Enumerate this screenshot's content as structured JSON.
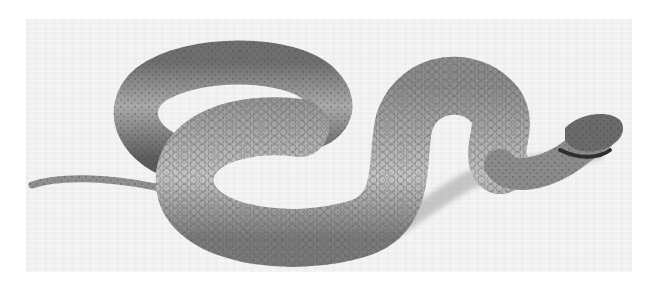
{
  "image": {
    "subject": "snake",
    "description": "Black-and-white photograph of a viper in an S-shaped coil on a pale background, head at right, thin tail extending left",
    "tone": "grayscale",
    "colors": {
      "page_background": "#ffffff",
      "photo_background": "#f1f1f1",
      "body_mid": "#8a8a8a",
      "body_light": "#bdbdbd",
      "body_dark": "#4a4a4a",
      "shadow": "#2a2a2a"
    }
  }
}
